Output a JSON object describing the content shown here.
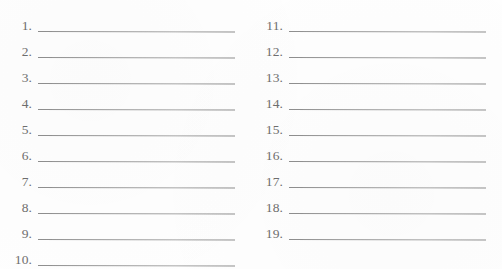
{
  "document": {
    "type": "numbered-blank-list-form",
    "background_color": "#fefefe",
    "rule_color": "#9b9b9b",
    "number_color": "#6e6e6e"
  },
  "columns": [
    {
      "name": "left-column",
      "items": [
        {
          "number": "1."
        },
        {
          "number": "2."
        },
        {
          "number": "3."
        },
        {
          "number": "4."
        },
        {
          "number": "5."
        },
        {
          "number": "6."
        },
        {
          "number": "7."
        },
        {
          "number": "8."
        },
        {
          "number": "9."
        },
        {
          "number": "10."
        }
      ]
    },
    {
      "name": "right-column",
      "items": [
        {
          "number": "11."
        },
        {
          "number": "12."
        },
        {
          "number": "13."
        },
        {
          "number": "14."
        },
        {
          "number": "15."
        },
        {
          "number": "16."
        },
        {
          "number": "17."
        },
        {
          "number": "18."
        },
        {
          "number": "19."
        }
      ]
    }
  ]
}
